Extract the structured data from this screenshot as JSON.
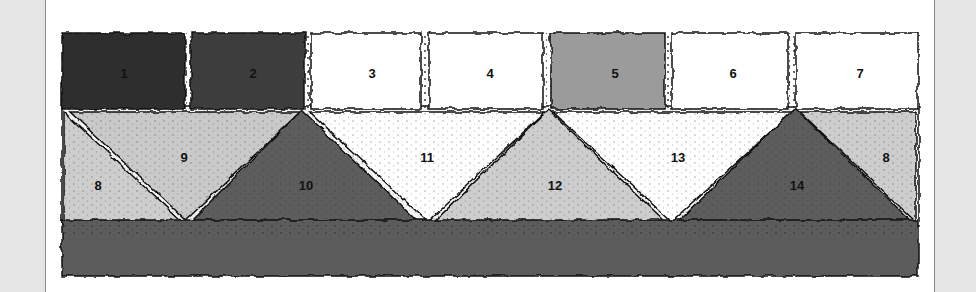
{
  "figure": {
    "type": "quilt-pattern-diagram",
    "colors": {
      "black": "#2d2d2d",
      "dark": "#3c3c3c",
      "medium_dark": "#5d5d5d",
      "medium": "#9b9b9b",
      "light": "#cdcdcd",
      "white": "#ffffff",
      "outline": "#111111",
      "side_panel": "#e6e6e6"
    },
    "top_row": [
      {
        "id": "1",
        "label": "1",
        "tone": "black"
      },
      {
        "id": "2",
        "label": "2",
        "tone": "dark"
      },
      {
        "id": "3",
        "label": "3",
        "tone": "white"
      },
      {
        "id": "4",
        "label": "4",
        "tone": "white"
      },
      {
        "id": "5",
        "label": "5",
        "tone": "medium"
      },
      {
        "id": "6",
        "label": "6",
        "tone": "white"
      },
      {
        "id": "7",
        "label": "7",
        "tone": "white"
      }
    ],
    "triangles": [
      {
        "id": "8-left",
        "label": "8",
        "tone": "light"
      },
      {
        "id": "9",
        "label": "9",
        "tone": "light"
      },
      {
        "id": "10",
        "label": "10",
        "tone": "medium_dark"
      },
      {
        "id": "11",
        "label": "11",
        "tone": "white"
      },
      {
        "id": "12",
        "label": "12",
        "tone": "light"
      },
      {
        "id": "13",
        "label": "13",
        "tone": "white"
      },
      {
        "id": "14",
        "label": "14",
        "tone": "medium_dark"
      },
      {
        "id": "8-right",
        "label": "8",
        "tone": "light"
      }
    ],
    "bottom_band": {
      "tone": "medium_dark",
      "label": ""
    }
  }
}
